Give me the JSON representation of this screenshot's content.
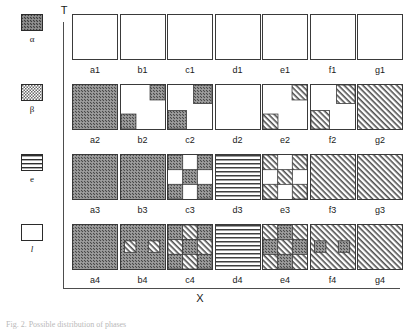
{
  "figure": {
    "axes": {
      "y_label": "T",
      "x_label": "X"
    },
    "caption": "Fig. 2. Possible distribution of phases"
  },
  "legend": {
    "entries": [
      {
        "symbol": "α",
        "pattern": "alpha",
        "italic": false
      },
      {
        "symbol": "β",
        "pattern": "beta",
        "italic": false
      },
      {
        "symbol": "e",
        "pattern": "e",
        "italic": false
      },
      {
        "symbol": "l",
        "pattern": "l",
        "italic": true
      }
    ]
  },
  "grid": {
    "columns": [
      "a",
      "b",
      "c",
      "d",
      "e",
      "f",
      "g"
    ],
    "rows": [
      "1",
      "2",
      "3",
      "4"
    ],
    "cells": [
      {
        "label": "a1",
        "base": "l",
        "patches": []
      },
      {
        "label": "b1",
        "base": "l",
        "patches": []
      },
      {
        "label": "c1",
        "base": "l",
        "patches": []
      },
      {
        "label": "d1",
        "base": "l",
        "patches": []
      },
      {
        "label": "e1",
        "base": "l",
        "patches": []
      },
      {
        "label": "f1",
        "base": "l",
        "patches": []
      },
      {
        "label": "g1",
        "base": "l",
        "patches": []
      },
      {
        "label": "a2",
        "base": "alpha",
        "patches": []
      },
      {
        "label": "b2",
        "base": "l",
        "patches": [
          {
            "pattern": "alpha",
            "x": 66,
            "y": 0,
            "w": 34,
            "h": 34
          },
          {
            "pattern": "alpha",
            "x": 0,
            "y": 66,
            "w": 34,
            "h": 34
          }
        ]
      },
      {
        "label": "c2",
        "base": "l",
        "patches": [
          {
            "pattern": "alpha",
            "x": 58,
            "y": 0,
            "w": 42,
            "h": 42
          },
          {
            "pattern": "alpha",
            "x": 0,
            "y": 58,
            "w": 42,
            "h": 42
          }
        ]
      },
      {
        "label": "d2",
        "base": "l",
        "patches": []
      },
      {
        "label": "e2",
        "base": "l",
        "patches": [
          {
            "pattern": "beta",
            "x": 66,
            "y": 0,
            "w": 34,
            "h": 34
          },
          {
            "pattern": "beta",
            "x": 0,
            "y": 66,
            "w": 34,
            "h": 34
          }
        ]
      },
      {
        "label": "f2",
        "base": "l",
        "patches": [
          {
            "pattern": "beta",
            "x": 58,
            "y": 0,
            "w": 42,
            "h": 42
          },
          {
            "pattern": "beta",
            "x": 0,
            "y": 58,
            "w": 42,
            "h": 42
          }
        ]
      },
      {
        "label": "g2",
        "base": "beta",
        "patches": []
      },
      {
        "label": "a3",
        "base": "alpha",
        "patches": []
      },
      {
        "label": "b3",
        "base": "alpha",
        "patches": []
      },
      {
        "label": "c3",
        "base": "l",
        "patches": [
          {
            "pattern": "alpha",
            "x": 0,
            "y": 0,
            "w": 33.4,
            "h": 33.4
          },
          {
            "pattern": "alpha",
            "x": 66.6,
            "y": 0,
            "w": 33.4,
            "h": 33.4
          },
          {
            "pattern": "alpha",
            "x": 33.3,
            "y": 33.3,
            "w": 33.4,
            "h": 33.4
          },
          {
            "pattern": "alpha",
            "x": 0,
            "y": 66.6,
            "w": 33.4,
            "h": 33.4
          },
          {
            "pattern": "alpha",
            "x": 66.6,
            "y": 66.6,
            "w": 33.4,
            "h": 33.4
          }
        ]
      },
      {
        "label": "d3",
        "base": "e",
        "patches": []
      },
      {
        "label": "e3",
        "base": "l",
        "patches": [
          {
            "pattern": "beta",
            "x": 0,
            "y": 0,
            "w": 33.4,
            "h": 33.4
          },
          {
            "pattern": "beta",
            "x": 66.6,
            "y": 0,
            "w": 33.4,
            "h": 33.4
          },
          {
            "pattern": "beta",
            "x": 33.3,
            "y": 33.3,
            "w": 33.4,
            "h": 33.4
          },
          {
            "pattern": "beta",
            "x": 0,
            "y": 66.6,
            "w": 33.4,
            "h": 33.4
          },
          {
            "pattern": "beta",
            "x": 66.6,
            "y": 66.6,
            "w": 33.4,
            "h": 33.4
          }
        ]
      },
      {
        "label": "f3",
        "base": "beta",
        "patches": []
      },
      {
        "label": "g3",
        "base": "beta",
        "patches": []
      },
      {
        "label": "a4",
        "base": "alpha",
        "patches": []
      },
      {
        "label": "b4",
        "base": "alpha",
        "patches": [
          {
            "pattern": "beta",
            "x": 8,
            "y": 36,
            "w": 26,
            "h": 26
          },
          {
            "pattern": "beta",
            "x": 62,
            "y": 36,
            "w": 26,
            "h": 26
          }
        ]
      },
      {
        "label": "c4",
        "base": "l",
        "patches": [
          {
            "pattern": "alpha",
            "x": 0,
            "y": 0,
            "w": 33.4,
            "h": 33.4
          },
          {
            "pattern": "beta",
            "x": 33.3,
            "y": 0,
            "w": 33.4,
            "h": 33.4
          },
          {
            "pattern": "alpha",
            "x": 66.6,
            "y": 0,
            "w": 33.4,
            "h": 33.4
          },
          {
            "pattern": "beta",
            "x": 0,
            "y": 33.3,
            "w": 33.4,
            "h": 33.4
          },
          {
            "pattern": "alpha",
            "x": 33.3,
            "y": 33.3,
            "w": 33.4,
            "h": 33.4
          },
          {
            "pattern": "beta",
            "x": 66.6,
            "y": 33.3,
            "w": 33.4,
            "h": 33.4
          },
          {
            "pattern": "alpha",
            "x": 0,
            "y": 66.6,
            "w": 33.4,
            "h": 33.4
          },
          {
            "pattern": "beta",
            "x": 33.3,
            "y": 66.6,
            "w": 33.4,
            "h": 33.4
          },
          {
            "pattern": "alpha",
            "x": 66.6,
            "y": 66.6,
            "w": 33.4,
            "h": 33.4
          }
        ]
      },
      {
        "label": "d4",
        "base": "e",
        "patches": []
      },
      {
        "label": "e4",
        "base": "beta",
        "patches": [
          {
            "pattern": "alpha",
            "x": 33.3,
            "y": 0,
            "w": 33.4,
            "h": 33.4
          },
          {
            "pattern": "alpha",
            "x": 0,
            "y": 33.3,
            "w": 33.4,
            "h": 33.4
          },
          {
            "pattern": "alpha",
            "x": 66.6,
            "y": 33.3,
            "w": 33.4,
            "h": 33.4
          },
          {
            "pattern": "alpha",
            "x": 33.3,
            "y": 66.6,
            "w": 33.4,
            "h": 33.4
          }
        ]
      },
      {
        "label": "f4",
        "base": "beta",
        "patches": [
          {
            "pattern": "alpha",
            "x": 8,
            "y": 36,
            "w": 26,
            "h": 26
          },
          {
            "pattern": "alpha",
            "x": 62,
            "y": 36,
            "w": 26,
            "h": 26
          }
        ]
      },
      {
        "label": "g4",
        "base": "beta",
        "patches": []
      }
    ]
  },
  "colors": {
    "ink": "#1a1a1a",
    "axis": "#4d4d4d",
    "box_border": "#3a3a3a",
    "alpha_fill": "#6e6e6e",
    "beta_fill": "#9a9a9a",
    "background": "#ffffff"
  },
  "layout": {
    "cell_size": 46,
    "col_step": 47.5,
    "row_step": 70,
    "grid_left": 72,
    "grid_top": 14
  }
}
